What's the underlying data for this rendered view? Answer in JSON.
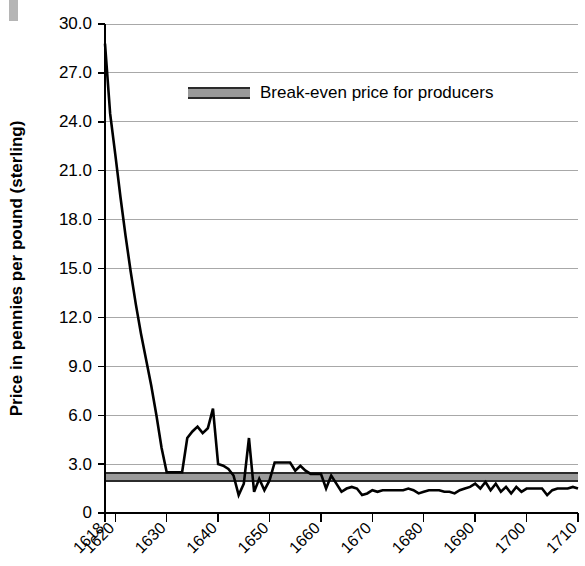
{
  "chart_data": {
    "type": "line",
    "title": "",
    "xlabel": "",
    "ylabel": "Price in pennies per pound (sterling)",
    "xlim": [
      1618,
      1710
    ],
    "ylim": [
      0,
      30
    ],
    "grid": true,
    "y_ticks": [
      0,
      3.0,
      6.0,
      9.0,
      12.0,
      15.0,
      18.0,
      21.0,
      24.0,
      27.0,
      30.0
    ],
    "y_tick_labels": [
      "0",
      "3.0",
      "6.0",
      "9.0",
      "12.0",
      "15.0",
      "18.0",
      "21.0",
      "24.0",
      "27.0",
      "30.0"
    ],
    "x_ticks": [
      1618,
      1620,
      1630,
      1640,
      1650,
      1660,
      1670,
      1680,
      1690,
      1700,
      1710
    ],
    "x_tick_labels": [
      "1618",
      "1620",
      "1630",
      "1640",
      "1650",
      "1660",
      "1670",
      "1680",
      "1690",
      "1700",
      "1710"
    ],
    "legend": {
      "position": "inside-top-center",
      "entries": [
        {
          "label": "Break-even price for producers",
          "marker": "band",
          "color": "#9a9a9a"
        }
      ]
    },
    "bands": [
      {
        "name": "break-even-band",
        "label": "Break-even price for producers",
        "y_low": 1.95,
        "y_high": 2.45,
        "x_start": 1618,
        "x_end": 1710,
        "fill": "#9a9a9a",
        "edge": "#2b2b2b"
      }
    ],
    "series": [
      {
        "name": "Tobacco price",
        "color": "#000000",
        "x": [
          1618,
          1619,
          1620,
          1621,
          1622,
          1623,
          1624,
          1625,
          1626,
          1627,
          1628,
          1629,
          1630,
          1631,
          1632,
          1633,
          1634,
          1635,
          1636,
          1637,
          1638,
          1639,
          1640,
          1641,
          1642,
          1643,
          1644,
          1645,
          1646,
          1647,
          1648,
          1649,
          1650,
          1651,
          1652,
          1653,
          1654,
          1655,
          1656,
          1657,
          1658,
          1659,
          1660,
          1661,
          1662,
          1663,
          1664,
          1665,
          1666,
          1667,
          1668,
          1669,
          1670,
          1671,
          1672,
          1673,
          1674,
          1675,
          1676,
          1677,
          1678,
          1679,
          1680,
          1681,
          1682,
          1683,
          1684,
          1685,
          1686,
          1687,
          1688,
          1689,
          1690,
          1691,
          1692,
          1693,
          1694,
          1695,
          1696,
          1697,
          1698,
          1699,
          1700,
          1701,
          1702,
          1703,
          1704,
          1705,
          1706,
          1707,
          1708,
          1709,
          1710
        ],
        "y": [
          28.8,
          24.5,
          22.0,
          19.4,
          17.0,
          14.8,
          12.8,
          11.0,
          9.4,
          7.8,
          6.0,
          4.0,
          2.5,
          2.5,
          2.5,
          2.5,
          4.6,
          5.0,
          5.3,
          4.9,
          5.2,
          6.4,
          3.0,
          2.9,
          2.7,
          2.3,
          1.1,
          1.8,
          4.6,
          1.3,
          2.1,
          1.4,
          2.0,
          3.1,
          3.1,
          3.1,
          3.1,
          2.6,
          2.9,
          2.6,
          2.4,
          2.4,
          2.4,
          1.5,
          2.3,
          1.8,
          1.3,
          1.5,
          1.6,
          1.5,
          1.1,
          1.2,
          1.4,
          1.3,
          1.4,
          1.4,
          1.4,
          1.4,
          1.4,
          1.5,
          1.4,
          1.2,
          1.3,
          1.4,
          1.4,
          1.4,
          1.3,
          1.3,
          1.2,
          1.4,
          1.5,
          1.6,
          1.8,
          1.5,
          1.9,
          1.4,
          1.8,
          1.3,
          1.6,
          1.2,
          1.6,
          1.3,
          1.5,
          1.5,
          1.5,
          1.5,
          1.1,
          1.4,
          1.5,
          1.5,
          1.5,
          1.6,
          1.5
        ]
      }
    ]
  }
}
